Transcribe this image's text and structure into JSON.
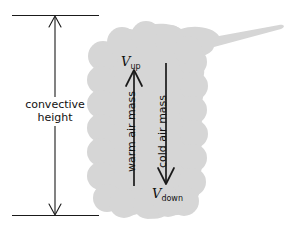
{
  "figure": {
    "background_color": "#ffffff",
    "cloud_color": "#d6d6d6",
    "line_color": "#1a1a1a"
  },
  "measure": {
    "label_line1": "convective",
    "label_line2": "height",
    "top_tick_y": 15,
    "bottom_tick_y": 215,
    "arrow_x": 55
  },
  "updraft": {
    "v_symbol": "V",
    "v_subscript": "up",
    "air_mass_label": "warm air mass",
    "arrow_direction": "up"
  },
  "downdraft": {
    "v_symbol": "V",
    "v_subscript": "down",
    "air_mass_label": "cold air mass",
    "arrow_direction": "down"
  }
}
